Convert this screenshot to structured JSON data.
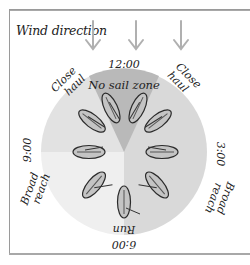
{
  "diagram": {
    "wind_label": "Wind direction",
    "wind_arrows": 3,
    "clock": {
      "top": "12:00",
      "right": "3:00",
      "bottom": "6:00",
      "left": "9:00"
    },
    "zones": {
      "no_sail": "No sail zone",
      "close_hauled_left": [
        "Close",
        "haul"
      ],
      "close_hauled_right": [
        "Close",
        "haul"
      ],
      "broad_reach_left": [
        "Broad",
        "reach"
      ],
      "broad_reach_right": [
        "Broad",
        "reach"
      ],
      "run": "Run"
    },
    "colors": {
      "frame": "#9a9a9a",
      "arrow": "#b0b0b0",
      "circle_right": "#d9d9d9",
      "circle_upper_left": "#e2e2e2",
      "circle_lower_left": "#efefef",
      "no_sail_cone": "#b9b9b9",
      "hull_fill": "#c4c4c4",
      "hull_stroke": "#2a2a2a"
    },
    "boats": [
      {
        "name": "close-hauled-left-1",
        "angle": -25
      },
      {
        "name": "close-hauled-left-2",
        "angle": -50
      },
      {
        "name": "beam-reach-left",
        "angle": -90
      },
      {
        "name": "broad-reach-left",
        "angle": -140
      },
      {
        "name": "run",
        "angle": 180
      },
      {
        "name": "broad-reach-right",
        "angle": 140
      },
      {
        "name": "beam-reach-right",
        "angle": 90
      },
      {
        "name": "close-hauled-right-2",
        "angle": 50
      },
      {
        "name": "close-hauled-right-1",
        "angle": 25
      }
    ]
  }
}
